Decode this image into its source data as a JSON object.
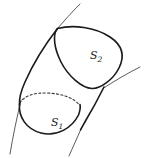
{
  "figure": {
    "type": "line-drawing",
    "width": 144,
    "height": 158,
    "background_color": "#ffffff",
    "ink_color": "#1a1a1a",
    "thin_ink_color": "#4a4a4a",
    "labels": [
      {
        "id": "s2",
        "base": "S",
        "subscript": "2",
        "text": "S2",
        "x": 90,
        "y": 50,
        "style": "italic-serif",
        "meaning": "upper cross-section surface"
      },
      {
        "id": "s1",
        "base": "S",
        "subscript": "1",
        "text": "S1",
        "x": 51,
        "y": 117,
        "style": "italic-serif",
        "meaning": "lower cross-section surface"
      }
    ],
    "strokes": [
      {
        "name": "upper-cross-section-ellipse",
        "kind": "solid",
        "stroke_width": 1.6,
        "closed": true,
        "path": "M 57.5 28.5 C 73 24.5 95 27 110 37 C 122 45 125 56 119 68 C 113 80 100 89 92 88.5 C 82 88 68 76 61 62 C 54.5 49 52 35 57.5 28.5 Z"
      },
      {
        "name": "tube-left-edge",
        "kind": "solid",
        "stroke_width": 1.6,
        "closed": false,
        "path": "M 57.5 28.5 C 47 42 33 64 25 82 C 20.5 92 19 99 19.5 105"
      },
      {
        "name": "tube-right-edge",
        "kind": "solid",
        "stroke_width": 1.6,
        "closed": false,
        "path": "M 104 87 C 99 97 92 110 86 120 C 83.5 124.5 81.5 128 80.5 130"
      },
      {
        "name": "lower-cross-section-visible-arc",
        "kind": "solid",
        "stroke_width": 1.6,
        "closed": false,
        "path": "M 19.5 104 C 18.5 117 26 129 41 133 C 57 137 72 128 78.5 115 C 80 111 80.5 107 80 104.5"
      },
      {
        "name": "lower-cross-section-hidden-arc",
        "kind": "dashed",
        "stroke_width": 1.1,
        "dash_pattern": "2.2 2.2",
        "closed": false,
        "path": "M 19.8 103 C 24 96 34 92.5 47 93 C 62 93.5 74 98 79.5 105"
      },
      {
        "name": "background-curve-upper",
        "kind": "solid-thin",
        "stroke_width": 0.9,
        "closed": false,
        "path": "M 80 4 C 72 12 64 21 57.5 28.5"
      },
      {
        "name": "background-curve-upper-right",
        "kind": "solid-thin",
        "stroke_width": 0.9,
        "closed": false,
        "path": "M 104.5 87.5 C 116 80 128 73 140 67"
      },
      {
        "name": "background-curve-lower-left",
        "kind": "solid-thin",
        "stroke_width": 0.9,
        "closed": false,
        "path": "M 21 100 C 17 117 13 136 10 154"
      },
      {
        "name": "background-curve-lower-right",
        "kind": "solid-thin",
        "stroke_width": 0.9,
        "closed": false,
        "path": "M 81.5 128 C 77 138 73 147 69 156"
      }
    ]
  }
}
